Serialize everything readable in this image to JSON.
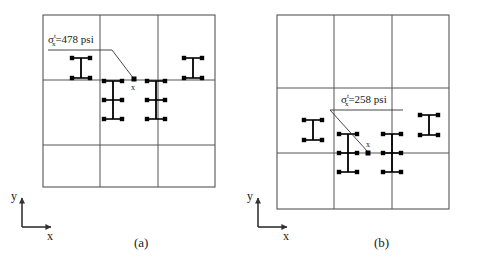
{
  "figure": {
    "type": "engineering-schematic",
    "background_color": "#ffffff",
    "line_color": "#4d4d4d",
    "symbol_color": "#000000"
  },
  "panels": [
    {
      "id": "a",
      "caption": "(a)",
      "callout": {
        "symbol": "σ",
        "superscript": "t",
        "subscript": "x",
        "equals": "=478 psi",
        "full_text": "σxt=478 psi",
        "value": 478,
        "unit": "psi",
        "marker": "x"
      },
      "axes": {
        "x_label": "x",
        "y_label": "y"
      },
      "grid": {
        "columns": 3,
        "rows": 3
      }
    },
    {
      "id": "b",
      "caption": "(b)",
      "callout": {
        "symbol": "σ",
        "superscript": "t",
        "subscript": "x",
        "equals": "=258 psi",
        "full_text": "σxt=258 psi",
        "value": 258,
        "unit": "psi",
        "marker": "x"
      },
      "axes": {
        "x_label": "x",
        "y_label": "y"
      },
      "grid": {
        "columns": 3,
        "rows": 3
      }
    }
  ]
}
